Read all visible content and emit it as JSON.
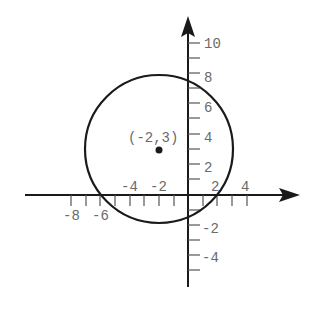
{
  "diagram": {
    "type": "circle-on-coordinate-plane",
    "center": {
      "x": -2,
      "y": 3
    },
    "radius": 5,
    "center_label": "(-2,3)",
    "x_axis": {
      "min_visible": -9,
      "max_visible": 6,
      "tick_step": 1,
      "labels": [
        {
          "value": -8,
          "text": "-8",
          "position": "below"
        },
        {
          "value": -6,
          "text": "-6",
          "position": "below"
        },
        {
          "value": -4,
          "text": "-4",
          "position": "above"
        },
        {
          "value": -2,
          "text": "-2",
          "position": "above"
        },
        {
          "value": 2,
          "text": "2",
          "position": "above"
        },
        {
          "value": 4,
          "text": "4",
          "position": "above"
        }
      ]
    },
    "y_axis": {
      "min_visible": -6,
      "max_visible": 11,
      "tick_step": 1,
      "labels": [
        {
          "value": 10,
          "text": "10"
        },
        {
          "value": 8,
          "text": "8"
        },
        {
          "value": 6,
          "text": "6"
        },
        {
          "value": 4,
          "text": "4"
        },
        {
          "value": 2,
          "text": "2"
        },
        {
          "value": -2,
          "text": "-2"
        },
        {
          "value": -4,
          "text": "-4"
        }
      ]
    },
    "colors": {
      "curve": "#1a1a1a",
      "axis": "#1a1a1a",
      "label": "#6a6a6a"
    }
  }
}
